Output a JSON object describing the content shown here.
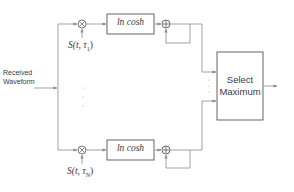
{
  "diagram": {
    "input_label_line1": "Received",
    "input_label_line2": "Waveform",
    "branches": [
      {
        "nonlinearity": "ln cosh",
        "signal_prefix": "S(t, τ",
        "signal_sub": "1",
        "signal_suffix": ")",
        "multiplier_symbol": "×",
        "adder_symbol": "+"
      },
      {
        "nonlinearity": "ln cosh",
        "signal_prefix": "S(t, τ",
        "signal_sub": "N",
        "signal_suffix": ")",
        "multiplier_symbol": "×",
        "adder_symbol": "+"
      }
    ],
    "selector_line1": "Select",
    "selector_line2": "Maximum",
    "ellipsis": "⋮",
    "colors": {
      "line": "#8a8a8a",
      "box_border": "#555555",
      "text": "#3a3a3a"
    }
  }
}
